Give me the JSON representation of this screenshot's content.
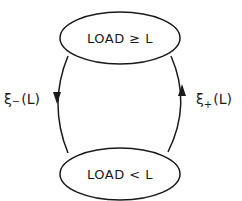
{
  "diagram": {
    "type": "state-transition",
    "states": [
      {
        "id": "high",
        "label": "LOAD ≥ L"
      },
      {
        "id": "low",
        "label": "LOAD < L"
      }
    ],
    "transitions": [
      {
        "from": "high",
        "to": "low",
        "symbol": "ξ",
        "subscript": "−",
        "arg": "(L)",
        "side": "left"
      },
      {
        "from": "low",
        "to": "high",
        "symbol": "ξ",
        "subscript": "+",
        "arg": "(L)",
        "side": "right"
      }
    ]
  },
  "colors": {
    "stroke": "#1a1a1a",
    "background": "#ffffff"
  }
}
